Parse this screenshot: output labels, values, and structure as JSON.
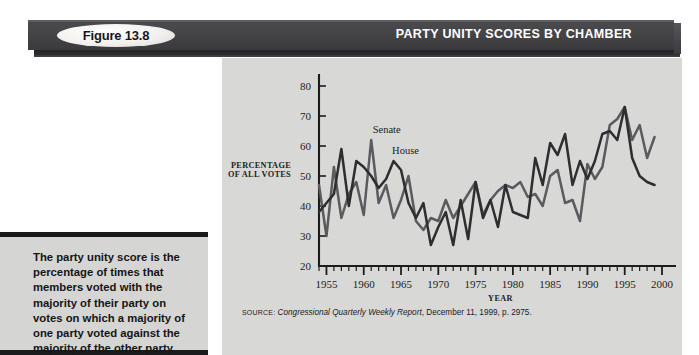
{
  "header": {
    "figure_badge": "Figure 13.8",
    "title": "PARTY UNITY SCORES BY CHAMBER"
  },
  "caption": {
    "text": "The party unity score is the percentage of times that members voted with the majority of their party on votes on which a majority of one party voted against the majority of the other party."
  },
  "source": {
    "prefix": "SOURCE:",
    "publication": "Congressional Quarterly Weekly Report",
    "rest": ", December 11, 1999, p. 2975."
  },
  "colors": {
    "banner_dark": "#454548",
    "panel_bg": "#d8d8d6",
    "caption_bg": "#d5d5d3",
    "senate_line": "#5a5a5f",
    "house_line": "#2e2e31",
    "axis": "#1d1d1d"
  },
  "chart_data": {
    "type": "line",
    "title": "PARTY UNITY SCORES BY CHAMBER",
    "xlabel": "YEAR",
    "ylabel": "PERCENTAGE OF ALL VOTES",
    "ylabel_line1": "PERCENTAGE",
    "ylabel_line2": "OF ALL VOTES",
    "xlim": [
      1954,
      2000
    ],
    "ylim": [
      20,
      80
    ],
    "yticks": [
      20,
      30,
      40,
      50,
      60,
      70,
      80
    ],
    "xticks_major": [
      1955,
      1960,
      1965,
      1970,
      1975,
      1980,
      1985,
      1990,
      1995,
      2000
    ],
    "xtick_minor_step": 1,
    "grid": false,
    "legend_position": "inline-annotation",
    "annotations": [
      {
        "text": "Senate",
        "x": 1961.2,
        "y": 64.5
      },
      {
        "text": "House",
        "x": 1963.8,
        "y": 57.5
      }
    ],
    "x": [
      1954,
      1955,
      1956,
      1957,
      1958,
      1959,
      1960,
      1961,
      1962,
      1963,
      1964,
      1965,
      1966,
      1967,
      1968,
      1969,
      1970,
      1971,
      1972,
      1973,
      1974,
      1975,
      1976,
      1977,
      1978,
      1979,
      1980,
      1981,
      1982,
      1983,
      1984,
      1985,
      1986,
      1987,
      1988,
      1989,
      1990,
      1991,
      1992,
      1993,
      1994,
      1995,
      1996,
      1997,
      1998,
      1999
    ],
    "series": [
      {
        "name": "Senate",
        "color": "#5a5a5f",
        "values": [
          47,
          30,
          53,
          36,
          44,
          48,
          37,
          62,
          41,
          47,
          36,
          42,
          50,
          35,
          32,
          36,
          35,
          42,
          36,
          40,
          44,
          48,
          37,
          42,
          45,
          47,
          46,
          48,
          43,
          44,
          40,
          50,
          52,
          41,
          42,
          35,
          54,
          49,
          53,
          67,
          69,
          73,
          62,
          67,
          56,
          63
        ]
      },
      {
        "name": "House",
        "color": "#2e2e31",
        "values": [
          38,
          41,
          44,
          59,
          40,
          55,
          53,
          50,
          46,
          49,
          55,
          52,
          41,
          36,
          41,
          27,
          33,
          38,
          27,
          42,
          29,
          48,
          36,
          42,
          33,
          47,
          38,
          37,
          36,
          56,
          47,
          61,
          57,
          64,
          47,
          55,
          49,
          55,
          64,
          65,
          62,
          73,
          56,
          50,
          48,
          47
        ]
      }
    ]
  }
}
